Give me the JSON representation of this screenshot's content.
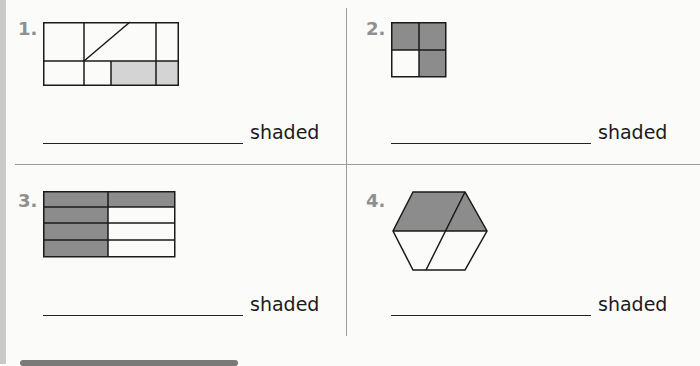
{
  "problems": [
    {
      "number": "1.",
      "figure": "rectangle split into 6 parts with diagonal, 2 bottom-right parts lightly shaded",
      "label": "shaded"
    },
    {
      "number": "2.",
      "figure": "square in 4 equal parts, 3 shaded",
      "label": "shaded"
    },
    {
      "number": "3.",
      "figure": "rectangle in 8 equal parts (2 columns × 4 rows), 5 shaded",
      "label": "shaded"
    },
    {
      "number": "4.",
      "figure": "hexagon in 4 parts, top 2 shaded",
      "label": "shaded"
    }
  ],
  "colors": {
    "shade_dark": "#8c8c8c",
    "shade_light": "#d4d4d4",
    "stroke": "#1a1a1a",
    "divider": "#9a9a9a"
  }
}
